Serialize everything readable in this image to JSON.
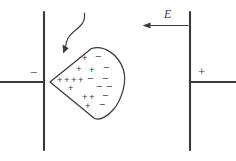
{
  "figure": {
    "colors": {
      "ink": "#3a3a3a",
      "background": "#ffffff"
    },
    "field": {
      "label": "E",
      "direction": "left",
      "arrow_x_start": 188,
      "arrow_x_end": 143,
      "arrow_y": 25
    },
    "left_plate": {
      "terminal_sign": "−",
      "x": 44,
      "y_top": 12,
      "y_bottom": 150,
      "wire_from_x": 0,
      "wire_y": 82
    },
    "right_plate": {
      "terminal_sign": "+",
      "x": 190,
      "y_top": 12,
      "y_bottom": 150,
      "wire_to_x": 236,
      "wire_y": 82
    },
    "leader": {
      "name": "curved-pointer-arrow",
      "from": [
        84,
        14
      ],
      "to": [
        63,
        52
      ]
    },
    "body": {
      "name": "polarized-wedge",
      "apex": [
        50,
        82
      ],
      "top_corner": [
        92,
        48
      ],
      "bottom_corner": [
        95,
        118
      ],
      "bulge_x": 125
    },
    "charges": [
      {
        "sign": "+",
        "x": 85,
        "y": 58
      },
      {
        "sign": "−",
        "x": 98,
        "y": 56
      },
      {
        "sign": "+",
        "x": 79,
        "y": 69
      },
      {
        "sign": "+",
        "x": 92,
        "y": 70
      },
      {
        "sign": "−",
        "x": 106,
        "y": 67
      },
      {
        "sign": "+",
        "x": 60,
        "y": 80
      },
      {
        "sign": "+",
        "x": 67,
        "y": 80
      },
      {
        "sign": "+",
        "x": 74,
        "y": 80
      },
      {
        "sign": "+",
        "x": 81,
        "y": 80
      },
      {
        "sign": "−",
        "x": 90,
        "y": 78
      },
      {
        "sign": "−",
        "x": 105,
        "y": 78
      },
      {
        "sign": "+",
        "x": 71,
        "y": 88
      },
      {
        "sign": "−",
        "x": 99,
        "y": 86
      },
      {
        "sign": "−",
        "x": 109,
        "y": 86
      },
      {
        "sign": "+",
        "x": 85,
        "y": 97
      },
      {
        "sign": "+",
        "x": 92,
        "y": 97
      },
      {
        "sign": "−",
        "x": 105,
        "y": 95
      },
      {
        "sign": "+",
        "x": 88,
        "y": 106
      },
      {
        "sign": "−",
        "x": 102,
        "y": 104
      }
    ]
  }
}
